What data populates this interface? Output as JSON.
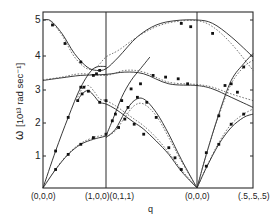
{
  "chart_data": {
    "type": "line",
    "title": "",
    "xlabel": "q",
    "ylabel": "ω [10¹³ rad sec⁻¹]",
    "ylim": [
      0,
      5.25
    ],
    "yticks": [
      1,
      2,
      3,
      4,
      5
    ],
    "grid": false,
    "legend": null,
    "x_segments": [
      {
        "from": "(0,0,0)",
        "to": "(1,0,0)",
        "x0": 0.0,
        "x1": 1.0
      },
      {
        "from": "(0,1,1)",
        "to": "(0,0,0)",
        "x0": 1.0,
        "x1": 2.45
      },
      {
        "from": "(0,0,0)",
        "to": "(.5,.5,.5)",
        "x0": 2.45,
        "x1": 3.35
      }
    ],
    "xtick_labels": [
      {
        "x": 0.0,
        "label": "(0,0,0)"
      },
      {
        "x": 1.0,
        "label": "(1,0,0)(0,1,1)"
      },
      {
        "x": 2.45,
        "label": "(0,0,0)"
      },
      {
        "x": 3.35,
        "label": "(.5,.5,.5)"
      }
    ],
    "series": [
      {
        "name": "branch-optic-top",
        "style": "solid",
        "x": [
          0,
          0.12,
          0.3,
          0.5,
          0.7,
          0.85,
          1.0,
          1.2,
          1.5,
          1.8,
          2.1,
          2.45,
          2.7,
          3.0,
          3.35
        ],
        "y": [
          5.0,
          4.98,
          4.6,
          4.0,
          3.6,
          3.5,
          3.55,
          3.9,
          4.5,
          4.85,
          4.98,
          5.0,
          4.9,
          4.5,
          3.9
        ]
      },
      {
        "name": "branch-optic-top-alt",
        "style": "dashed",
        "x": [
          0,
          0.12,
          0.3,
          0.5,
          0.7,
          0.85,
          1.0,
          1.2,
          1.5,
          1.8,
          2.1,
          2.45,
          2.7,
          3.0,
          3.35
        ],
        "y": [
          5.0,
          4.96,
          4.55,
          3.9,
          3.55,
          3.6,
          3.9,
          4.1,
          4.5,
          4.8,
          4.95,
          4.98,
          4.8,
          4.3,
          3.5
        ]
      },
      {
        "name": "branch-optic-flat",
        "style": "solid",
        "x": [
          0,
          0.3,
          0.6,
          1.0,
          1.3,
          1.6,
          2.0,
          2.45,
          2.7,
          3.0,
          3.35
        ],
        "y": [
          3.2,
          3.28,
          3.35,
          3.38,
          3.45,
          3.4,
          3.1,
          3.05,
          2.95,
          2.7,
          2.4
        ]
      },
      {
        "name": "branch-optic-flat-alt",
        "style": "dashed",
        "x": [
          0,
          0.3,
          0.6,
          1.0,
          1.3,
          1.6,
          2.0,
          2.45,
          2.7,
          3.0,
          3.35
        ],
        "y": [
          3.22,
          3.3,
          3.4,
          3.35,
          3.5,
          3.45,
          3.15,
          3.08,
          3.0,
          2.8,
          2.6
        ]
      },
      {
        "name": "branch-mid-hump",
        "style": "solid",
        "x": [
          0.55,
          0.62,
          0.72,
          0.82,
          0.9,
          1.0,
          1.15,
          1.3,
          1.45,
          1.6,
          1.8,
          2.0,
          2.2,
          2.45
        ],
        "y": [
          2.6,
          2.8,
          2.9,
          2.72,
          2.55,
          2.5,
          2.35,
          2.15,
          1.95,
          1.75,
          1.4,
          1.0,
          0.5,
          0.0
        ]
      },
      {
        "name": "branch-mid-hump-alt",
        "style": "dashed",
        "x": [
          0.55,
          0.62,
          0.72,
          0.82,
          0.9,
          1.0,
          1.15,
          1.3,
          1.45,
          1.6,
          1.8,
          2.0,
          2.2,
          2.45
        ],
        "y": [
          2.7,
          2.95,
          3.05,
          2.85,
          2.65,
          2.6,
          2.45,
          2.25,
          2.05,
          1.85,
          1.5,
          1.05,
          0.55,
          0.0
        ]
      },
      {
        "name": "branch-acoustic-LA-100",
        "style": "solid",
        "x": [
          0,
          0.2,
          0.4,
          0.6,
          0.8,
          1.0
        ],
        "y": [
          0.0,
          1.1,
          2.1,
          3.0,
          3.55,
          3.62
        ]
      },
      {
        "name": "branch-acoustic-TA-100",
        "style": "solid",
        "x": [
          0,
          0.2,
          0.4,
          0.6,
          0.8,
          0.95,
          1.0
        ],
        "y": [
          0.0,
          0.55,
          1.0,
          1.3,
          1.45,
          1.52,
          1.55
        ]
      },
      {
        "name": "branch-acoustic-TA-100-alt",
        "style": "dashed",
        "x": [
          0,
          0.2,
          0.4,
          0.6,
          0.8,
          0.95,
          1.0
        ],
        "y": [
          0.0,
          0.56,
          1.02,
          1.33,
          1.5,
          1.56,
          1.5
        ]
      },
      {
        "name": "branch-011-rise",
        "style": "solid",
        "x": [
          1.0,
          1.15,
          1.3,
          1.45,
          1.6,
          1.8,
          2.0,
          2.2,
          2.45
        ],
        "y": [
          1.5,
          1.75,
          2.25,
          2.6,
          2.65,
          2.25,
          1.6,
          0.85,
          0.0
        ]
      },
      {
        "name": "branch-011-rise-alt",
        "style": "dashed",
        "x": [
          1.0,
          1.15,
          1.3,
          1.45,
          1.6,
          1.8,
          2.0,
          2.2,
          2.45
        ],
        "y": [
          1.52,
          1.7,
          2.1,
          2.45,
          2.5,
          2.15,
          1.5,
          0.8,
          0.0
        ]
      },
      {
        "name": "branch-011-steep",
        "style": "solid",
        "x": [
          1.0,
          1.1,
          1.25,
          1.4,
          1.55,
          1.7
        ],
        "y": [
          1.55,
          2.0,
          2.7,
          3.2,
          3.55,
          3.9
        ]
      },
      {
        "name": "branch-111-LA",
        "style": "solid",
        "x": [
          2.45,
          2.6,
          2.8,
          3.0,
          3.2,
          3.35
        ],
        "y": [
          0.0,
          1.0,
          2.2,
          3.2,
          3.7,
          4.0
        ]
      },
      {
        "name": "branch-111-LA-alt",
        "style": "dashed",
        "x": [
          2.45,
          2.6,
          2.8,
          3.0,
          3.2,
          3.35
        ],
        "y": [
          0.0,
          1.0,
          2.15,
          3.1,
          3.6,
          3.8
        ]
      },
      {
        "name": "branch-111-TA",
        "style": "solid",
        "x": [
          2.45,
          2.6,
          2.8,
          3.0,
          3.2,
          3.35
        ],
        "y": [
          0.0,
          0.6,
          1.3,
          1.8,
          2.1,
          2.2
        ]
      },
      {
        "name": "branch-111-TA-alt",
        "style": "dashed",
        "x": [
          2.45,
          2.6,
          2.8,
          3.0,
          3.2,
          3.35
        ],
        "y": [
          0.0,
          0.62,
          1.35,
          1.9,
          2.2,
          2.35
        ]
      }
    ],
    "points": {
      "x": [
        0.2,
        0.4,
        0.6,
        0.2,
        0.4,
        0.6,
        0.8,
        1.0,
        0.15,
        0.35,
        0.6,
        0.8,
        0.85,
        0.9,
        0.65,
        0.72,
        0.55,
        0.62,
        0.9,
        1.0,
        1.15,
        1.3,
        1.45,
        1.6,
        1.1,
        1.25,
        1.4,
        1.55,
        1.2,
        1.35,
        1.5,
        1.65,
        1.8,
        2.0,
        2.1,
        2.2,
        2.6,
        2.8,
        3.0,
        3.2,
        2.6,
        2.8,
        3.0,
        3.2,
        2.2,
        2.35,
        2.7,
        2.9,
        3.1,
        1.75,
        1.95,
        2.15,
        2.3
      ],
      "y": [
        1.1,
        2.1,
        3.0,
        0.55,
        1.0,
        1.3,
        1.5,
        1.6,
        4.85,
        4.3,
        3.75,
        3.35,
        3.4,
        3.5,
        3.0,
        2.88,
        2.6,
        2.8,
        2.55,
        2.6,
        2.2,
        2.05,
        1.9,
        1.6,
        2.0,
        2.6,
        2.95,
        3.1,
        1.8,
        2.4,
        2.7,
        2.55,
        2.1,
        1.2,
        0.9,
        0.55,
        1.05,
        2.15,
        3.1,
        3.6,
        0.65,
        1.3,
        1.9,
        2.2,
        4.9,
        4.8,
        4.6,
        3.05,
        2.85,
        3.35,
        3.3,
        3.25,
        3.1
      ]
    }
  },
  "axes": {
    "y_label_omega": "ω",
    "y_label_unit": "[10¹³ rad sec⁻¹]",
    "x_label": "q",
    "y_ticks": [
      "1",
      "2",
      "3",
      "4",
      "5"
    ],
    "x_ticks": [
      "(0,0,0)",
      "(1,0,0)(0,1,1)",
      "(0,0,0)",
      "(.5,.5,.5)"
    ]
  }
}
